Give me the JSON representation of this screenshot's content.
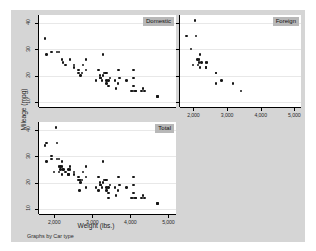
{
  "figure": {
    "background_color": "#d5d5d5",
    "panel_background_color": "#ffffff",
    "panel_title_background": "#b8b8b8",
    "marker_color": "#161616",
    "gridline_color": "#e8e8e8",
    "note": "Graphs by Car type"
  },
  "chart_data": {
    "type": "scatter",
    "title": "",
    "xlabel": "Weight (lbs.)",
    "ylabel": "Mileage (mpg)",
    "xlim": [
      1600,
      5200
    ],
    "ylim": [
      8,
      43
    ],
    "xticks": [
      2000,
      3000,
      4000,
      5000
    ],
    "xtick_labels": [
      "2,000",
      "3,000",
      "4,000",
      "5,000"
    ],
    "yticks": [
      10,
      20,
      30,
      40
    ],
    "ytick_labels": [
      "10",
      "20",
      "30",
      "40"
    ],
    "grid": "horizontal",
    "legend_position": "none",
    "note": "Graphs by Car type",
    "panels": [
      {
        "label": "Domestic",
        "n": 52,
        "x": [
          4080,
          3670,
          3690,
          3280,
          4330,
          3900,
          4290,
          3350,
          3250,
          4080,
          4720,
          3430,
          3380,
          4070,
          3620,
          3600,
          4130,
          4370,
          4030,
          4720,
          3370,
          4130,
          4080,
          3720,
          3370,
          3100,
          2750,
          3470,
          3210,
          3200,
          3420,
          3310,
          3210,
          2830,
          2730,
          2640,
          2690,
          2640,
          3170,
          2520,
          2830,
          2200,
          2520,
          2300,
          2230,
          2130,
          2070,
          1930,
          1800,
          3280,
          2410,
          1760
        ],
        "y": [
          22,
          17,
          22,
          20,
          15,
          18,
          14,
          21,
          18,
          19,
          12,
          16,
          17,
          14,
          15,
          18,
          14,
          14,
          14,
          12,
          18,
          14,
          16,
          19,
          21,
          18,
          24,
          19,
          19,
          20,
          18,
          21,
          19,
          22,
          21,
          21,
          20,
          22,
          22,
          23,
          26,
          26,
          24,
          24,
          25,
          29,
          29,
          29,
          28,
          28,
          26,
          34
        ]
      },
      {
        "label": "Foreign",
        "n": 22,
        "x": [
          2830,
          2050,
          2410,
          2200,
          2670,
          2370,
          2130,
          2160,
          2670,
          3170,
          2200,
          2670,
          1800,
          1990,
          2120,
          2160,
          2240,
          2370,
          2370,
          3420,
          1930,
          2070
        ],
        "y": [
          18,
          41,
          25,
          28,
          21,
          25,
          24,
          25,
          17,
          17,
          23,
          21,
          35,
          24,
          26,
          26,
          25,
          23,
          23,
          14,
          30,
          35
        ]
      },
      {
        "label": "Total",
        "n": 74,
        "x": [
          4080,
          3670,
          3690,
          3280,
          4330,
          3900,
          4290,
          3350,
          3250,
          4080,
          4720,
          3430,
          3380,
          4070,
          3620,
          3600,
          4130,
          4370,
          4030,
          4720,
          3370,
          4130,
          4080,
          3720,
          3370,
          3100,
          2750,
          3470,
          3210,
          3200,
          3420,
          3310,
          3210,
          2830,
          2730,
          2640,
          2690,
          2640,
          3170,
          2520,
          2830,
          2200,
          2520,
          2300,
          2230,
          2130,
          2070,
          1930,
          1800,
          3280,
          2410,
          1760,
          2830,
          2050,
          2410,
          2200,
          2670,
          2370,
          2130,
          2160,
          2670,
          3170,
          2200,
          2670,
          1800,
          1990,
          2120,
          2160,
          2240,
          2370,
          2370,
          3420,
          1930,
          2070
        ],
        "y": [
          22,
          17,
          22,
          20,
          15,
          18,
          14,
          21,
          18,
          19,
          12,
          16,
          17,
          14,
          15,
          18,
          14,
          14,
          14,
          12,
          18,
          14,
          16,
          19,
          21,
          18,
          24,
          19,
          19,
          20,
          18,
          21,
          19,
          22,
          21,
          21,
          20,
          22,
          22,
          23,
          26,
          26,
          24,
          24,
          25,
          29,
          29,
          29,
          28,
          28,
          26,
          34,
          18,
          41,
          25,
          28,
          21,
          25,
          24,
          25,
          17,
          17,
          23,
          21,
          35,
          24,
          26,
          26,
          25,
          23,
          23,
          14,
          30,
          35
        ]
      }
    ]
  }
}
